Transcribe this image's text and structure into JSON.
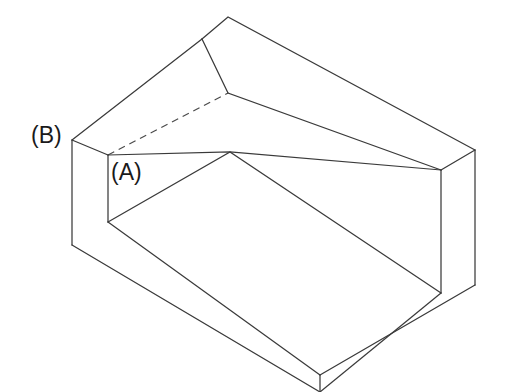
{
  "drawing": {
    "title": "Isometric view of U-shaped channel block",
    "type": "isometric-line-drawing",
    "background_color": "#ffffff",
    "line_color": "#3a3a3a",
    "hidden_line_color": "#4a4a4a",
    "label_color": "#1a1a1a",
    "canvas": {
      "width": 507,
      "height": 392
    },
    "labels": [
      {
        "id": "b",
        "text": "(B)",
        "x": 31,
        "y": 124
      },
      {
        "id": "a",
        "text": "(A)",
        "x": 111,
        "y": 161
      }
    ],
    "geometry": {
      "outline_polygon": "72,140 202,77 228,17 475,150 475,285 320,375 72,245",
      "back_rail_top_face": "202,39 228,17 475,150 441,170",
      "back_rail_right_end": "475,150 441,170 441,293 475,285",
      "left_block_top_face": "72,140 202,77 228,93 108,155",
      "left_block_front_face": "72,140 108,158 108,222 72,245",
      "notch_top_face": "108,155 228,93 202,39 72,140",
      "inner_floor": "108,222 230,152 441,293 320,375",
      "inner_back_wall_left": "108,155 230,152 230,152 108,222",
      "inner_back_wall_right": "230,152 441,170 441,293 230,152",
      "front_lower_face": "72,245 108,222 320,375 320,392",
      "right_outer_face": "441,170 475,150 475,285 441,293",
      "hidden_line": "108,155 228,93"
    }
  }
}
